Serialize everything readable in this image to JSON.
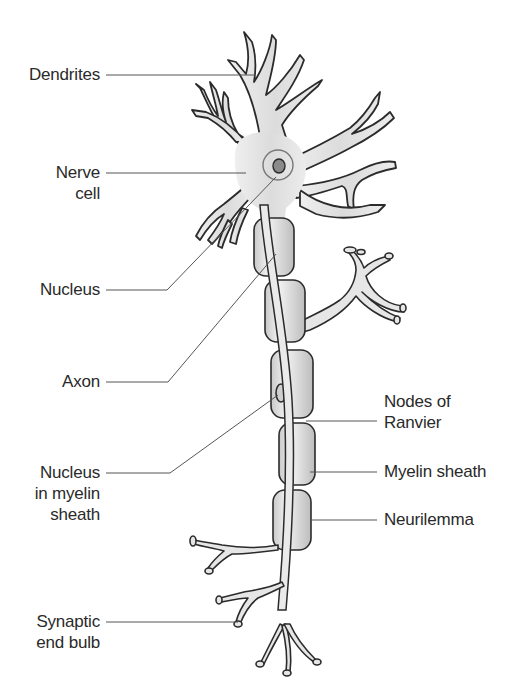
{
  "diagram": {
    "colors": {
      "cell_fill": "#e4e4e4",
      "sheath_fill": "#d6d6d6",
      "outline": "#2b2b2b",
      "leader_line": "#555555",
      "label_text": "#2a2a2a",
      "background": "#ffffff"
    },
    "labels_left": [
      {
        "id": "dendrites",
        "text": "Dendrites"
      },
      {
        "id": "nerve-cell",
        "text": "Nerve\ncell"
      },
      {
        "id": "nucleus",
        "text": "Nucleus"
      },
      {
        "id": "axon",
        "text": "Axon"
      },
      {
        "id": "nucleus-in-myelin-sheath",
        "text": "Nucleus\nin myelin\nsheath"
      },
      {
        "id": "synaptic-end-bulb",
        "text": "Synaptic\nend bulb"
      }
    ],
    "labels_right": [
      {
        "id": "nodes-of-ranvier",
        "text": "Nodes of\nRanvier"
      },
      {
        "id": "myelin-sheath",
        "text": "Myelin sheath"
      },
      {
        "id": "neurilemma",
        "text": "Neurilemma"
      }
    ]
  }
}
